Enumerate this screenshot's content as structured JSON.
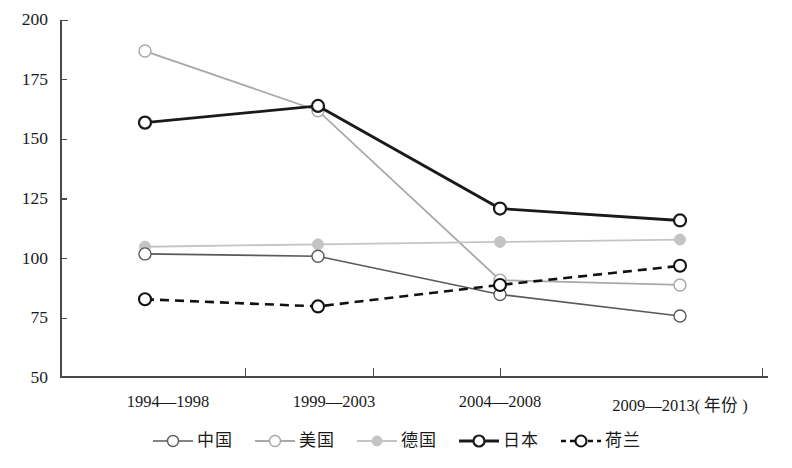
{
  "chart_data": {
    "type": "line",
    "title": "",
    "xlabel": "年份",
    "ylabel": "",
    "categories": [
      "1994—1998",
      "1999—2003",
      "2004—2008",
      "2009—2013"
    ],
    "xtick_labels": [
      "1994—1998",
      "1999—2003",
      "2004—2008",
      "2009—2013( 年份 )"
    ],
    "ytick_labels": [
      "200",
      "175",
      "150",
      "125",
      "100",
      "75",
      "50"
    ],
    "ytick_values": [
      200,
      175,
      150,
      125,
      100,
      75,
      50
    ],
    "ylim": [
      50,
      200
    ],
    "grid": false,
    "legend_position": "bottom",
    "series": [
      {
        "name": "中国",
        "values": [
          102,
          101,
          85,
          76
        ],
        "color": "#5a5a5a",
        "marker": "open-circle",
        "line_style": "solid",
        "line_width": 1.6
      },
      {
        "name": "美国",
        "values": [
          187,
          162,
          91,
          89
        ],
        "color": "#a8a8a8",
        "marker": "open-circle",
        "line_style": "solid",
        "line_width": 1.8
      },
      {
        "name": "德国",
        "values": [
          105,
          106,
          107,
          108
        ],
        "color": "#c4c4c4",
        "marker": "filled-circle",
        "line_style": "solid",
        "line_width": 1.8
      },
      {
        "name": "日本",
        "values": [
          157,
          164,
          121,
          116
        ],
        "color": "#1a1a1a",
        "marker": "open-circle",
        "line_style": "solid",
        "line_width": 2.8
      },
      {
        "name": "荷兰",
        "values": [
          83,
          80,
          89,
          97
        ],
        "color": "#111111",
        "marker": "open-circle",
        "line_style": "dashed",
        "line_width": 2.6
      }
    ]
  },
  "legend": {
    "items": [
      {
        "label": "中国"
      },
      {
        "label": "美国"
      },
      {
        "label": "德国"
      },
      {
        "label": "日本"
      },
      {
        "label": "荷兰"
      }
    ]
  },
  "axes": {
    "x_unit_label": "( 年份 )"
  }
}
